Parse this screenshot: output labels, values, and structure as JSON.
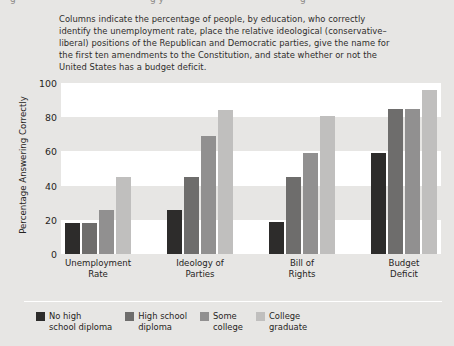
{
  "page": {
    "background": "#e7e6e4",
    "top_cut_fragments": [
      "g",
      "g y",
      "g"
    ]
  },
  "caption": {
    "text": "Columns indicate the percentage of people, by education, who correctly identify the unemployment rate, place the relative ideological (conservative–liberal) positions of the Republican and Democratic parties, give the name for the first ten amendments to the Constitution, and state whether or not the United States has a budget deficit."
  },
  "legend": {
    "items": [
      {
        "label": "No high\nschool diploma",
        "color": "#2d2c2b"
      },
      {
        "label": "High school\ndiploma",
        "color": "#6e6d6c"
      },
      {
        "label": "Some\ncollege",
        "color": "#919090"
      },
      {
        "label": "College\ngraduate",
        "color": "#c0bfbe"
      }
    ]
  },
  "chart_data": {
    "type": "bar",
    "title": "",
    "subtitle": "",
    "xlabel": "",
    "ylabel": "Percentage Answering Correctly",
    "ylim": [
      0,
      100
    ],
    "yticks": [
      0,
      20,
      40,
      60,
      80,
      100
    ],
    "ytick_labels": [
      "0",
      "20",
      "40",
      "60",
      "80",
      "100"
    ],
    "grid": "horizontal alternating white bands every 20 units",
    "legend_position": "bottom-left",
    "categories": [
      "Unemployment\nRate",
      "Ideology of\nParties",
      "Bill of\nRights",
      "Budget\nDeficit"
    ],
    "series": [
      {
        "name": "No high school diploma",
        "color": "#2d2c2b",
        "values": [
          18,
          26,
          19,
          59
        ]
      },
      {
        "name": "High school diploma",
        "color": "#6e6d6c",
        "values": [
          18,
          45,
          45,
          85
        ]
      },
      {
        "name": "Some college",
        "color": "#919090",
        "values": [
          26,
          69,
          59,
          85
        ]
      },
      {
        "name": "College graduate",
        "color": "#c0bfbe",
        "values": [
          45,
          84,
          81,
          96
        ]
      }
    ]
  }
}
